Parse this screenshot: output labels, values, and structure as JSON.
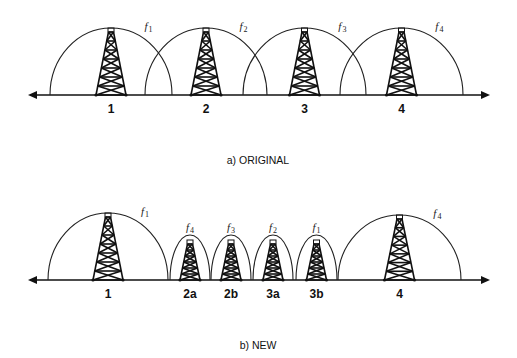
{
  "panels": [
    {
      "caption": "a)  ORIGINAL",
      "axis_y": 95,
      "axis_x": [
        28,
        490
      ],
      "cells": [
        {
          "label": "1",
          "freq": "f",
          "freq_sub": "1",
          "x0": 50,
          "x1": 172,
          "peak": 28,
          "tower_w": 30,
          "size": "large"
        },
        {
          "label": "2",
          "freq": "f",
          "freq_sub": "2",
          "x0": 145,
          "x1": 267,
          "peak": 28,
          "tower_w": 30,
          "size": "large"
        },
        {
          "label": "3",
          "freq": "f",
          "freq_sub": "3",
          "x0": 243,
          "x1": 366,
          "peak": 28,
          "tower_w": 30,
          "size": "large"
        },
        {
          "label": "4",
          "freq": "f",
          "freq_sub": "4",
          "x0": 340,
          "x1": 463,
          "peak": 28,
          "tower_w": 30,
          "size": "large"
        }
      ]
    },
    {
      "caption": "b)  NEW",
      "axis_y": 280,
      "axis_x": [
        28,
        490
      ],
      "cells": [
        {
          "label": "1",
          "freq": "f",
          "freq_sub": "1",
          "x0": 48,
          "x1": 168,
          "peak": 213,
          "tower_w": 30,
          "size": "large"
        },
        {
          "label": "2a",
          "freq": "f",
          "freq_sub": "4",
          "x0": 170,
          "x1": 210,
          "peak": 235,
          "tower_w": 20,
          "size": "small"
        },
        {
          "label": "2b",
          "freq": "f",
          "freq_sub": "3",
          "x0": 211,
          "x1": 251,
          "peak": 235,
          "tower_w": 20,
          "size": "small"
        },
        {
          "label": "3a",
          "freq": "f",
          "freq_sub": "2",
          "x0": 253,
          "x1": 293,
          "peak": 235,
          "tower_w": 20,
          "size": "small"
        },
        {
          "label": "3b",
          "freq": "f",
          "freq_sub": "1",
          "x0": 296,
          "x1": 337,
          "peak": 235,
          "tower_w": 20,
          "size": "small"
        },
        {
          "label": "4",
          "freq": "f",
          "freq_sub": "4",
          "x0": 338,
          "x1": 461,
          "peak": 215,
          "tower_w": 30,
          "size": "large"
        }
      ]
    }
  ],
  "colors": {
    "line": "#111111",
    "background": "#ffffff"
  }
}
